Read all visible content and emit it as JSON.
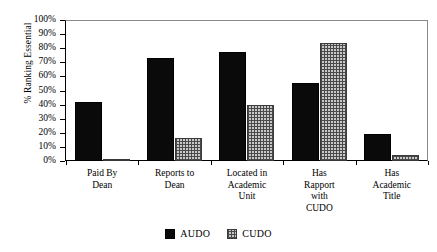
{
  "chart_data": {
    "type": "bar",
    "title": "",
    "xlabel": "",
    "ylabel": "% Ranking Essential",
    "ylim": [
      0,
      100
    ],
    "ytick_labels": [
      "100%",
      "90%",
      "80%",
      "70%",
      "60%",
      "50%",
      "40%",
      "30%",
      "20%",
      "10%",
      "0%"
    ],
    "ytick_values": [
      100,
      90,
      80,
      70,
      60,
      50,
      40,
      30,
      20,
      10,
      0
    ],
    "grid": false,
    "legend_position": "bottom-center",
    "categories": [
      "Paid By Dean",
      "Reports to Dean",
      "Located in Academic Unit",
      "Has Rapport with CUDO",
      "Has Academic Title"
    ],
    "category_label_lines": [
      [
        "Paid By",
        "Dean"
      ],
      [
        "Reports to",
        "Dean"
      ],
      [
        "Located in",
        "Academic",
        "Unit"
      ],
      [
        "Has",
        "Rapport",
        "with",
        "CUDO"
      ],
      [
        "Has",
        "Academic",
        "Title"
      ]
    ],
    "series": [
      {
        "name": "AUDO",
        "fill": "solid-black",
        "color": "#0a0a0a",
        "values": [
          42,
          73,
          77,
          55,
          19
        ]
      },
      {
        "name": "CUDO",
        "fill": "cross-hatch",
        "color": "#c9c9c9",
        "values": [
          1,
          16,
          40,
          84,
          4
        ]
      }
    ]
  },
  "legend": {
    "items": [
      {
        "label": "AUDO",
        "swatch": "solid-black-swatch"
      },
      {
        "label": "CUDO",
        "swatch": "cross-hatch-swatch"
      }
    ]
  }
}
